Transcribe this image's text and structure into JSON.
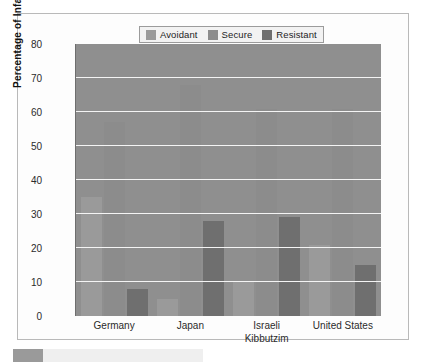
{
  "chart_data": {
    "type": "bar",
    "title": "",
    "subtitle": "",
    "xlabel": "",
    "ylabel": "Percentage of Infants",
    "ylim": [
      0,
      80
    ],
    "yticks": [
      0,
      10,
      20,
      30,
      40,
      50,
      60,
      70,
      80
    ],
    "grid": true,
    "legend_position": "top-center",
    "categories": [
      "Germany",
      "Japan",
      "Israeli Kibbutzim",
      "United States"
    ],
    "category_lines": [
      [
        "Germany",
        ""
      ],
      [
        "Japan",
        ""
      ],
      [
        "Israeli",
        "Kibbutzim"
      ],
      [
        "United States",
        ""
      ]
    ],
    "series": [
      {
        "name": "Avoidant",
        "color": "#9a9a9a",
        "values": [
          35,
          5,
          10,
          21
        ]
      },
      {
        "name": "Secure",
        "color": "#8c8c8c",
        "values": [
          57,
          68,
          61,
          61
        ]
      },
      {
        "name": "Resistant",
        "color": "#6f6f6f",
        "values": [
          8,
          28,
          29,
          15
        ]
      }
    ]
  },
  "legend": {
    "items": [
      {
        "label": "Avoidant",
        "color": "#9a9a9a"
      },
      {
        "label": "Secure",
        "color": "#8c8c8c"
      },
      {
        "label": "Resistant",
        "color": "#6f6f6f"
      }
    ]
  },
  "axes": {
    "y_title": "Percentage of Infants",
    "y_labels": [
      "80",
      "70",
      "60",
      "50",
      "40",
      "30",
      "20",
      "10",
      "0"
    ],
    "x_labels": [
      "Germany",
      "Japan",
      "Israeli",
      "Kibbutzim",
      "United States"
    ]
  },
  "colors": {
    "plot_background": "#8f8f8f",
    "gridline": "#f4f4f4",
    "frame": "#b9b9b9",
    "page_background": "#ffffff"
  }
}
